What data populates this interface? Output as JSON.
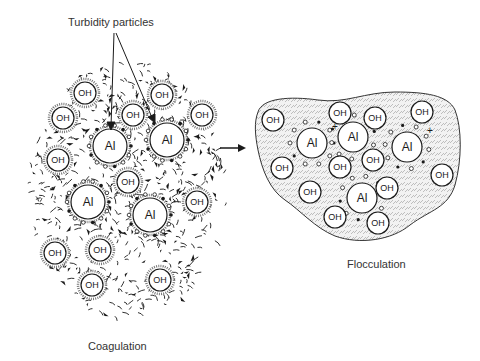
{
  "diagram": {
    "labels": {
      "turbidity": "Turbidity particles",
      "coagulation": "Coagulation",
      "flocculation": "Flocculation"
    },
    "particle_labels": {
      "hydroxide": "OH",
      "aluminum": "Al",
      "charge": "+"
    },
    "colors": {
      "ink": "#1a1a1a",
      "background": "#ffffff",
      "floc_fill": "#e8e8e8",
      "text": "#333333"
    },
    "coagulation": {
      "al": [
        {
          "x": 110,
          "y": 146,
          "r": 17
        },
        {
          "x": 167,
          "y": 140,
          "r": 17
        },
        {
          "x": 88,
          "y": 202,
          "r": 17
        },
        {
          "x": 150,
          "y": 215,
          "r": 17
        }
      ],
      "oh": [
        {
          "x": 85,
          "y": 93,
          "r": 11
        },
        {
          "x": 63,
          "y": 118,
          "r": 11
        },
        {
          "x": 133,
          "y": 115,
          "r": 11
        },
        {
          "x": 162,
          "y": 95,
          "r": 11
        },
        {
          "x": 202,
          "y": 115,
          "r": 11
        },
        {
          "x": 58,
          "y": 160,
          "r": 11
        },
        {
          "x": 128,
          "y": 182,
          "r": 11
        },
        {
          "x": 197,
          "y": 202,
          "r": 11
        },
        {
          "x": 55,
          "y": 253,
          "r": 11
        },
        {
          "x": 100,
          "y": 250,
          "r": 11
        },
        {
          "x": 92,
          "y": 285,
          "r": 11
        },
        {
          "x": 160,
          "y": 280,
          "r": 11
        }
      ]
    },
    "flocculation": {
      "al": [
        {
          "x": 312,
          "y": 143,
          "r": 15
        },
        {
          "x": 353,
          "y": 137,
          "r": 15
        },
        {
          "x": 407,
          "y": 147,
          "r": 15
        },
        {
          "x": 362,
          "y": 198,
          "r": 15
        }
      ],
      "oh": [
        {
          "x": 273,
          "y": 120,
          "r": 11
        },
        {
          "x": 340,
          "y": 113,
          "r": 11
        },
        {
          "x": 375,
          "y": 118,
          "r": 11
        },
        {
          "x": 422,
          "y": 112,
          "r": 11
        },
        {
          "x": 282,
          "y": 168,
          "r": 11
        },
        {
          "x": 340,
          "y": 167,
          "r": 11
        },
        {
          "x": 373,
          "y": 160,
          "r": 11
        },
        {
          "x": 442,
          "y": 175,
          "r": 11
        },
        {
          "x": 310,
          "y": 192,
          "r": 11
        },
        {
          "x": 387,
          "y": 188,
          "r": 11
        },
        {
          "x": 335,
          "y": 217,
          "r": 11
        },
        {
          "x": 378,
          "y": 223,
          "r": 11
        }
      ]
    }
  }
}
